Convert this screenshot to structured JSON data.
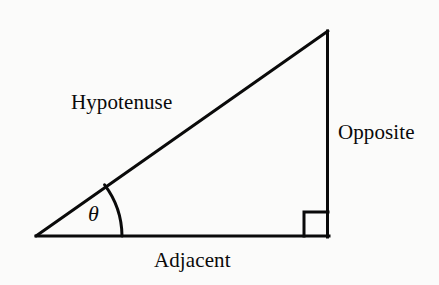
{
  "diagram": {
    "type": "right-triangle-trigonometry",
    "background_color": "#fbfbfa",
    "stroke_color": "#0a0a0a",
    "labels": {
      "hypotenuse": "Hypotenuse",
      "opposite": "Opposite",
      "adjacent": "Adjacent",
      "angle": "θ"
    },
    "geometry": {
      "left_vertex": [
        36,
        236
      ],
      "right_angle_vertex": [
        328,
        236
      ],
      "apex_vertex": [
        328,
        31
      ],
      "right_angle_marker": {
        "x": 304,
        "y": 212,
        "size": 24
      },
      "angle_arc_radius": 86,
      "stroke_width": 3
    }
  }
}
